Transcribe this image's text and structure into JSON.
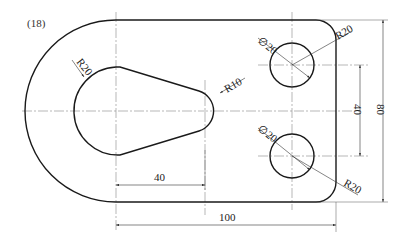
{
  "figure": {
    "number_label": "(18)"
  },
  "dimensions": {
    "inner_arc_radius": "R20",
    "tip_radius": "R10",
    "upper_hole_diameter": "∅20",
    "lower_hole_diameter": "∅20",
    "upper_corner_radius": "R20",
    "lower_corner_radius": "R20",
    "hole_spacing_vertical": "40",
    "overall_height": "80",
    "slot_length": "40",
    "overall_length": "100"
  },
  "colors": {
    "line": "#1a1a1a",
    "centerline": "#888888",
    "background": "#ffffff"
  }
}
